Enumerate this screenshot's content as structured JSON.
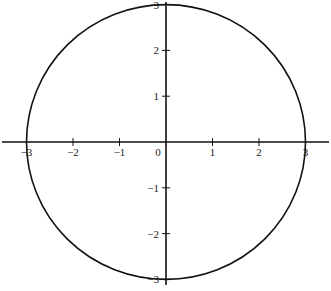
{
  "chart_data": {
    "type": "line",
    "title": "",
    "xlabel": "",
    "ylabel": "",
    "series": [
      {
        "name": "circle",
        "center": [
          0,
          0
        ],
        "radius": 3
      }
    ],
    "xlim": [
      -3.5,
      3.5
    ],
    "ylim": [
      -3,
      3
    ],
    "x_ticks": [
      -3,
      -2,
      -1,
      0,
      1,
      2,
      3
    ],
    "y_ticks": [
      -3,
      -2,
      -1,
      1,
      2,
      3
    ],
    "x_tick_labels": [
      "−3",
      "−2",
      "−1",
      "0",
      "1",
      "2",
      "3"
    ],
    "y_tick_labels": [
      "−3",
      "−2",
      "−1",
      "1",
      "2",
      "3"
    ],
    "grid": false,
    "legend": null
  }
}
